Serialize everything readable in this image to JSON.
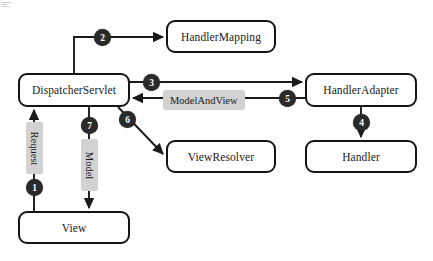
{
  "diagram": {
    "type": "flowchart",
    "canvas": {
      "width": 433,
      "height": 261,
      "background": "#ffffff"
    },
    "colors": {
      "node_border": "#151515",
      "node_fill": "#ffffff",
      "badge_fill": "#2a2a2a",
      "badge_text": "#ffffff",
      "chip_fill": "#d2d2d2",
      "edge": "#1a1a1a"
    },
    "nodes": [
      {
        "id": "dispatcher",
        "label": "DispatcherServlet",
        "x": 18,
        "y": 73,
        "w": 112,
        "h": 34
      },
      {
        "id": "handler_mapping",
        "label": "HandlerMapping",
        "x": 166,
        "y": 20,
        "w": 110,
        "h": 33
      },
      {
        "id": "handler_adapter",
        "label": "HandlerAdapter",
        "x": 305,
        "y": 73,
        "w": 112,
        "h": 34
      },
      {
        "id": "handler",
        "label": "Handler",
        "x": 305,
        "y": 140,
        "w": 112,
        "h": 33
      },
      {
        "id": "view_resolver",
        "label": "ViewResolver",
        "x": 166,
        "y": 140,
        "w": 110,
        "h": 33
      },
      {
        "id": "view",
        "label": "View",
        "x": 18,
        "y": 211,
        "w": 112,
        "h": 33
      }
    ],
    "steps": [
      {
        "number": "1",
        "x": 30,
        "y": 179,
        "edge": "View to DispatcherServlet (Request)"
      },
      {
        "number": "2",
        "x": 98,
        "y": 30,
        "edge": "DispatcherServlet to HandlerMapping"
      },
      {
        "number": "3",
        "x": 148,
        "y": 76,
        "edge": "DispatcherServlet to HandlerAdapter"
      },
      {
        "number": "4",
        "x": 353,
        "y": 117,
        "edge": "HandlerAdapter to Handler"
      },
      {
        "number": "5",
        "x": 282,
        "y": 94,
        "edge": "HandlerAdapter to DispatcherServlet (ModelAndView)"
      },
      {
        "number": "6",
        "x": 124,
        "y": 114,
        "edge": "DispatcherServlet to ViewResolver"
      },
      {
        "number": "7",
        "x": 85,
        "y": 119,
        "edge": "DispatcherServlet to View (Model)"
      }
    ],
    "edge_labels": [
      {
        "text": "Request",
        "orientation": "vertical",
        "x": 26,
        "y": 122,
        "w": 17,
        "h": 52
      },
      {
        "text": "Model",
        "orientation": "vertical",
        "x": 81,
        "y": 139,
        "w": 17,
        "h": 52
      },
      {
        "text": "ModelAndView",
        "orientation": "horizontal",
        "x": 163,
        "y": 90,
        "w": 98,
        "h": 16
      }
    ]
  }
}
